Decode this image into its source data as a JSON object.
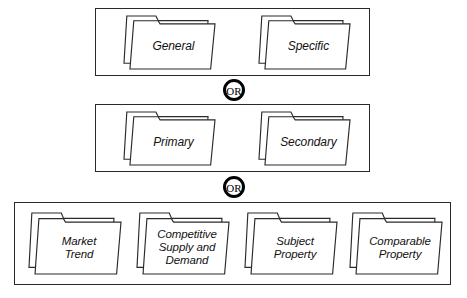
{
  "diagram": {
    "connector_label": "OR",
    "line_color": "#2a2a2a",
    "connector_color": "#000000",
    "background_color": "#ffffff",
    "groups": [
      {
        "id": "group-1",
        "box": {
          "x": 95,
          "y": 8,
          "w": 275,
          "h": 68
        },
        "folders": [
          {
            "id": "folder-general",
            "label": "General",
            "x": 123,
            "y": 15,
            "w": 93,
            "h": 55,
            "font_size": 12
          },
          {
            "id": "folder-specific",
            "label": "Specific",
            "x": 258,
            "y": 15,
            "w": 93,
            "h": 55,
            "font_size": 12
          }
        ]
      },
      {
        "id": "group-2",
        "box": {
          "x": 95,
          "y": 104,
          "w": 275,
          "h": 68
        },
        "folders": [
          {
            "id": "folder-primary",
            "label": "Primary",
            "x": 123,
            "y": 111,
            "w": 93,
            "h": 55,
            "font_size": 12
          },
          {
            "id": "folder-secondary",
            "label": "Secondary",
            "x": 258,
            "y": 111,
            "w": 93,
            "h": 55,
            "font_size": 12
          }
        ]
      },
      {
        "id": "group-3",
        "box": {
          "x": 14,
          "y": 202,
          "w": 437,
          "h": 83
        },
        "folders": [
          {
            "id": "folder-market-trend",
            "label": "Market\nTrend",
            "x": 28,
            "y": 212,
            "w": 94,
            "h": 63,
            "font_size": 11.5
          },
          {
            "id": "folder-competitive-supply-and-demand",
            "label": "Competitive\nSupply and\nDemand",
            "x": 136,
            "y": 212,
            "w": 94,
            "h": 63,
            "font_size": 11.5
          },
          {
            "id": "folder-subject-property",
            "label": "Subject\nProperty",
            "x": 244,
            "y": 212,
            "w": 94,
            "h": 63,
            "font_size": 11.5
          },
          {
            "id": "folder-comparable-property",
            "label": "Comparable\nProperty",
            "x": 349,
            "y": 212,
            "w": 94,
            "h": 63,
            "font_size": 11.5
          }
        ]
      }
    ],
    "connectors": [
      {
        "id": "or-connector-1",
        "label": "OR",
        "cx": 234,
        "cy": 90,
        "r": 11
      },
      {
        "id": "or-connector-2",
        "label": "OR",
        "cx": 234,
        "cy": 187,
        "r": 11
      }
    ]
  }
}
